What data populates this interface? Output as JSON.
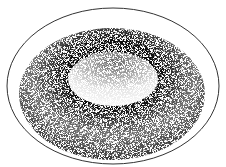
{
  "image": {
    "subject": "stippled illustration of a torus-shaped cell inside a thin outer membrane",
    "colors": {
      "background": "#ffffff",
      "ink": "#1a1a1a",
      "outline": "#333333"
    }
  }
}
